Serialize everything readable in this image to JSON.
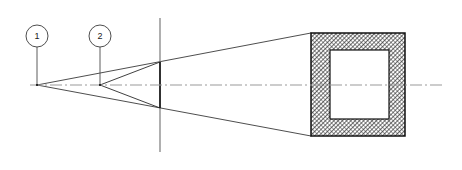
{
  "diagram": {
    "type": "technical-line-drawing",
    "canvas": {
      "width": 462,
      "height": 170,
      "background": "#ffffff"
    },
    "colors": {
      "line": "#1a1a1a",
      "thin_line": "#4a4a4a",
      "centerline": "#8c8c8c",
      "hatch": "#2b2b2b",
      "background": "#ffffff",
      "callout_fill": "#ffffff"
    },
    "centerline": {
      "label": "axis-centerline",
      "style": "dash-dot",
      "y": 85,
      "x_start": 30,
      "x_end": 442
    },
    "reference_plane": {
      "label": "vertical-reference-line",
      "x": 160,
      "y_top": 18,
      "y_bottom": 152,
      "aperture_top_y": 62,
      "aperture_bottom_y": 108
    },
    "callouts": [
      {
        "id": "1",
        "label": "1",
        "circle": {
          "cx": 37,
          "cy": 36,
          "r": 11
        },
        "leader": {
          "x1": 37,
          "y1": 47,
          "x2": 37,
          "y2": 85
        },
        "apex": {
          "x": 37,
          "y": 85
        }
      },
      {
        "id": "2",
        "label": "2",
        "circle": {
          "cx": 100,
          "cy": 36,
          "r": 11
        },
        "leader": {
          "x1": 100,
          "y1": 47,
          "x2": 100,
          "y2": 85
        },
        "apex": {
          "x": 100,
          "y": 85
        }
      }
    ],
    "cones": [
      {
        "name": "outer-cone-from-point-1",
        "apex": {
          "x": 37,
          "y": 85
        },
        "target_top": {
          "x": 311,
          "y": 33
        },
        "target_bottom": {
          "x": 311,
          "y": 136
        }
      },
      {
        "name": "inner-cone-from-point-2",
        "apex": {
          "x": 100,
          "y": 85
        },
        "target_top": {
          "x": 160,
          "y": 62
        },
        "target_bottom": {
          "x": 160,
          "y": 108
        }
      }
    ],
    "section": {
      "name": "square-tube-section",
      "outer": {
        "x": 311,
        "y": 33,
        "width": 94,
        "height": 103
      },
      "inner": {
        "x": 330,
        "y": 50,
        "width": 59,
        "height": 69
      },
      "hatch_pattern": "cross-hatch-diagonal",
      "hatch_angle_deg": 45,
      "hatch_spacing_px": 2
    }
  }
}
